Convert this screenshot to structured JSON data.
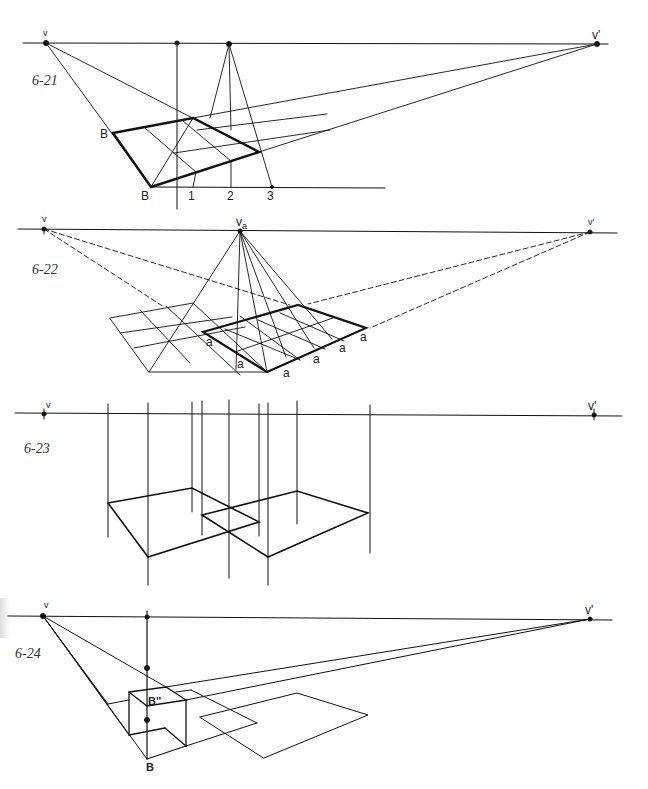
{
  "figures": [
    {
      "id": "6-21",
      "label": "6-21",
      "points": {
        "v": "v",
        "v_prime": "v'",
        "B_top": "B",
        "B_bottom": "B",
        "n1": "1",
        "n2": "2",
        "n3": "3"
      }
    },
    {
      "id": "6-22",
      "label": "6-22",
      "points": {
        "v": "v",
        "va": "v",
        "va_sub": "a",
        "v_prime": "v'",
        "a": "a"
      }
    },
    {
      "id": "6-23",
      "label": "6-23",
      "points": {
        "v": "v",
        "v_prime": "v'"
      }
    },
    {
      "id": "6-24",
      "label": "6-24",
      "points": {
        "v": "v",
        "v_prime": "v'",
        "B2": "B''",
        "B": "B"
      }
    }
  ],
  "colors": {
    "ink": "#111111",
    "background": "#ffffff"
  }
}
